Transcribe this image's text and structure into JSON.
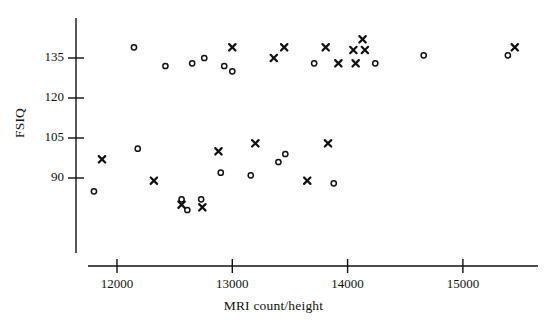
{
  "chart_data": {
    "type": "scatter",
    "title": "",
    "xlabel": "MRI count/height",
    "ylabel": "FSIQ",
    "xlim": [
      11700,
      15550
    ],
    "ylim": [
      77,
      144
    ],
    "xticks": [
      12000,
      13000,
      14000,
      15000
    ],
    "yticks": [
      90,
      105,
      120,
      135
    ],
    "xtick_labels": [
      "12000",
      "13000",
      "14000",
      "15000"
    ],
    "ytick_labels": [
      "90",
      "105",
      "120",
      "135"
    ],
    "grid": false,
    "legend": null,
    "legend_position": "none",
    "marker_color": "#111111",
    "series": [
      {
        "name": "circle",
        "marker": "o",
        "points": [
          [
            12147,
            139
          ],
          [
            12420,
            132
          ],
          [
            12652,
            133
          ],
          [
            12757,
            135
          ],
          [
            12930,
            132
          ],
          [
            13000,
            130
          ],
          [
            13710,
            133
          ],
          [
            14240,
            133
          ],
          [
            14660,
            136
          ],
          [
            15390,
            136
          ],
          [
            12180,
            101
          ],
          [
            11800,
            85
          ],
          [
            12560,
            82
          ],
          [
            12730,
            82
          ],
          [
            12610,
            78
          ],
          [
            12900,
            92
          ],
          [
            13160,
            91
          ],
          [
            13400,
            96
          ],
          [
            13460,
            99
          ],
          [
            13880,
            88
          ]
        ]
      },
      {
        "name": "cross",
        "marker": "x",
        "points": [
          [
            13000,
            139
          ],
          [
            13450,
            139
          ],
          [
            13810,
            139
          ],
          [
            14050,
            138
          ],
          [
            14150,
            138
          ],
          [
            14130,
            142
          ],
          [
            13360,
            135
          ],
          [
            13920,
            133
          ],
          [
            14070,
            133
          ],
          [
            15450,
            139
          ],
          [
            11870,
            97
          ],
          [
            12320,
            89
          ],
          [
            12560,
            80
          ],
          [
            12740,
            79
          ],
          [
            12880,
            100
          ],
          [
            13200,
            103
          ],
          [
            13830,
            103
          ],
          [
            13650,
            89
          ]
        ]
      }
    ]
  },
  "axes": {
    "ylabel_text": "FSIQ",
    "xlabel_text": "MRI count/height"
  }
}
